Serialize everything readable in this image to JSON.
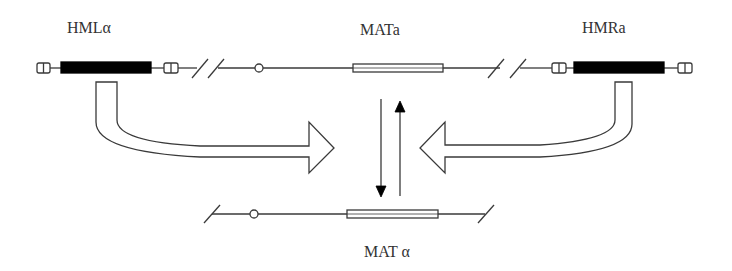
{
  "diagram": {
    "colors": {
      "line": "#3a3a3a",
      "silent_cassette_fill": "#000000",
      "background": "#ffffff"
    },
    "loci": {
      "hml": {
        "label": "HMLα",
        "position": "left",
        "state": "silent",
        "type": "alpha"
      },
      "mat_top": {
        "label": "MATa",
        "position": "center-top",
        "state": "expressed",
        "type": "a"
      },
      "hmr": {
        "label": "HMRa",
        "position": "right",
        "state": "silent",
        "type": "a"
      },
      "mat_bottom": {
        "label": "MAT α",
        "position": "center-bottom",
        "state": "expressed",
        "type": "alpha"
      }
    },
    "arrows": [
      {
        "name": "hml-to-mat",
        "from": "HMLα",
        "to": "MAT",
        "style": "hollow-curved"
      },
      {
        "name": "hmr-to-mat",
        "from": "HMRa",
        "to": "MAT",
        "style": "hollow-curved"
      },
      {
        "name": "mata-to-matalpha",
        "from": "MATa",
        "to": "MAT α",
        "style": "solid-down"
      },
      {
        "name": "matalpha-to-mata",
        "from": "MAT α",
        "to": "MATa",
        "style": "solid-up"
      }
    ]
  }
}
